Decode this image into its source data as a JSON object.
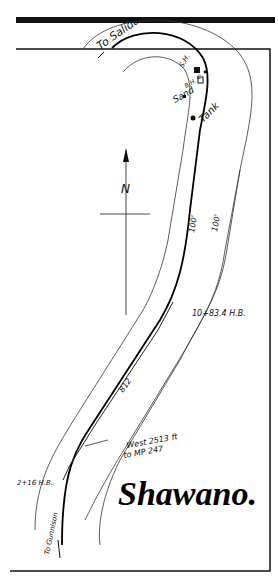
{
  "map": {
    "title": "Shawano.",
    "labels": {
      "to_salida": "To Salida",
      "to_gunnison": "To Gunnison",
      "sh": "S.H.",
      "c": "C",
      "bh": "B.H.",
      "sand": "Sand",
      "tank": "Tank",
      "north": "N",
      "width_left": "100'",
      "width_right": "100'",
      "station_north": "10+83.4 H.B.",
      "station_south": "2+16 H.B.",
      "siding_length": "812",
      "milepost_note_line1": "West 2513 ft",
      "milepost_note_line2": "to MP 247"
    },
    "colors": {
      "ink": "#111111",
      "paper": "#ffffff"
    }
  }
}
